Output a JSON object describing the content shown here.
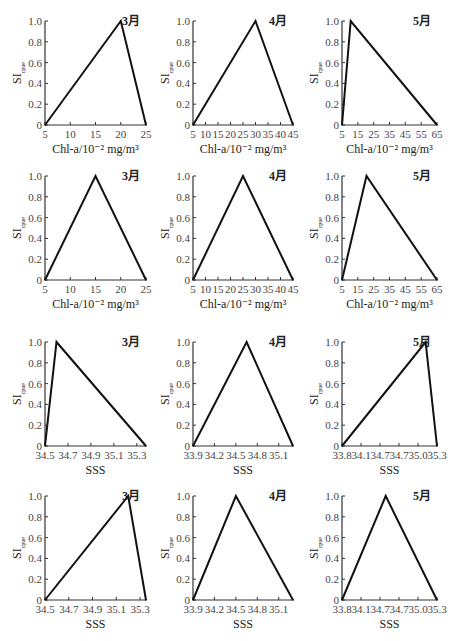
{
  "figure": {
    "ylabel_main": "SI",
    "ylabel_sub": "cpue"
  },
  "chart_data": [
    {
      "type": "line",
      "row": 1,
      "col": 1,
      "month": "3月",
      "xlabel": "Chl-a/10⁻² mg/m³",
      "ylabel": "SI_cpue",
      "xticks": [
        "5",
        "10",
        "15",
        "20",
        "25"
      ],
      "xlim": [
        5,
        25
      ],
      "yticks": [
        "0",
        "0.2",
        "0.4",
        "0.6",
        "0.8",
        "1.0"
      ],
      "ylim": [
        0,
        1
      ],
      "points": [
        [
          5,
          0
        ],
        [
          20,
          1.0
        ],
        [
          25,
          0
        ]
      ]
    },
    {
      "type": "line",
      "row": 1,
      "col": 2,
      "month": "4月",
      "xlabel": "Chl-a/10⁻² mg/m³",
      "ylabel": "SI_cpue",
      "xticks": [
        "5",
        "10",
        "15",
        "20",
        "25",
        "30",
        "35",
        "40",
        "45"
      ],
      "xlim": [
        5,
        45
      ],
      "yticks": [
        "0",
        "0.2",
        "0.4",
        "0.6",
        "0.8",
        "1.0"
      ],
      "ylim": [
        0,
        1
      ],
      "points": [
        [
          5,
          0
        ],
        [
          30,
          1.0
        ],
        [
          45,
          0
        ]
      ]
    },
    {
      "type": "line",
      "row": 1,
      "col": 3,
      "month": "5月",
      "xlabel": "Chl-a/10⁻² mg/m³",
      "ylabel": "SI_cpue",
      "xticks": [
        "5",
        "15",
        "25",
        "35",
        "45",
        "55",
        "65"
      ],
      "xlim": [
        5,
        65
      ],
      "yticks": [
        "0",
        "0.2",
        "0.4",
        "0.6",
        "0.8",
        "1.0"
      ],
      "ylim": [
        0,
        1
      ],
      "points": [
        [
          5,
          0
        ],
        [
          10.5,
          1.0
        ],
        [
          65,
          0
        ]
      ]
    },
    {
      "type": "line",
      "row": 2,
      "col": 1,
      "month": "3月",
      "xlabel": "Chl-a/10⁻² mg/m³",
      "ylabel": "SI_cpue",
      "xticks": [
        "5",
        "10",
        "15",
        "20",
        "25"
      ],
      "xlim": [
        5,
        25
      ],
      "yticks": [
        "0",
        "0.2",
        "0.4",
        "0.6",
        "0.8",
        "1.0"
      ],
      "ylim": [
        0,
        1
      ],
      "points": [
        [
          5,
          0
        ],
        [
          15,
          1.0
        ],
        [
          25,
          0
        ]
      ]
    },
    {
      "type": "line",
      "row": 2,
      "col": 2,
      "month": "4月",
      "xlabel": "Chl-a/10⁻² mg/m³",
      "ylabel": "SI_cpue",
      "xticks": [
        "5",
        "10",
        "15",
        "20",
        "25",
        "30",
        "35",
        "40",
        "45"
      ],
      "xlim": [
        5,
        45
      ],
      "yticks": [
        "0",
        "0.2",
        "0.4",
        "0.6",
        "0.8",
        "1.0"
      ],
      "ylim": [
        0,
        1
      ],
      "points": [
        [
          5,
          0
        ],
        [
          25,
          1.0
        ],
        [
          45,
          0
        ]
      ]
    },
    {
      "type": "line",
      "row": 2,
      "col": 3,
      "month": "5月",
      "xlabel": "Chl-a/10⁻² mg/m³",
      "ylabel": "SI_cpue",
      "xticks": [
        "5",
        "15",
        "25",
        "35",
        "45",
        "55",
        "65"
      ],
      "xlim": [
        5,
        65
      ],
      "yticks": [
        "0",
        "0.2",
        "0.4",
        "0.6",
        "0.8",
        "1.0"
      ],
      "ylim": [
        0,
        1
      ],
      "points": [
        [
          5,
          0
        ],
        [
          20.5,
          1.0
        ],
        [
          65,
          0
        ]
      ]
    },
    {
      "type": "line",
      "row": 3,
      "col": 1,
      "month": "3月",
      "xlabel": "SSS",
      "ylabel": "SI_cpue",
      "xticks": [
        "34.5",
        "34.7",
        "34.9",
        "35.1",
        "35.3"
      ],
      "xtick_values": [
        34.5,
        34.7,
        34.9,
        35.1,
        35.3
      ],
      "xlim": [
        34.5,
        35.38
      ],
      "yticks": [
        "0",
        "0.2",
        "0.4",
        "0.6",
        "0.8",
        "1.0"
      ],
      "ylim": [
        0,
        1
      ],
      "points": [
        [
          34.5,
          0
        ],
        [
          34.6,
          1.0
        ],
        [
          35.38,
          0
        ]
      ]
    },
    {
      "type": "line",
      "row": 3,
      "col": 2,
      "month": "4月",
      "xlabel": "SSS",
      "ylabel": "SI_cpue",
      "xticks": [
        "33.9",
        "34.2",
        "34.5",
        "34.8",
        "35.1"
      ],
      "xtick_values": [
        33.9,
        34.2,
        34.5,
        34.8,
        35.1
      ],
      "xlim": [
        33.9,
        35.3
      ],
      "yticks": [
        "0",
        "0.2",
        "0.4",
        "0.6",
        "0.8",
        "1.0"
      ],
      "ylim": [
        0,
        1
      ],
      "points": [
        [
          33.9,
          0
        ],
        [
          34.65,
          1.0
        ],
        [
          35.3,
          0
        ]
      ]
    },
    {
      "type": "line",
      "row": 3,
      "col": 3,
      "month": "5月",
      "xlabel": "SSS",
      "ylabel": "SI_cpue",
      "xticks": [
        "33.8",
        "34.1",
        "34.7",
        "34.7",
        "35.0",
        "35.3"
      ],
      "xtick_positions": [
        0,
        0.2,
        0.4,
        0.6,
        0.8,
        1.0
      ],
      "xlim": [
        33.8,
        35.3
      ],
      "yticks": [
        "0",
        "0.2",
        "0.4",
        "0.6",
        "0.8",
        "1.0"
      ],
      "ylim": [
        0,
        1
      ],
      "points_normalized": [
        [
          0,
          0
        ],
        [
          0.88,
          1.0
        ],
        [
          1.0,
          0
        ]
      ]
    },
    {
      "type": "line",
      "row": 4,
      "col": 1,
      "month": "3月",
      "xlabel": "SSS",
      "ylabel": "SI_cpue",
      "xticks": [
        "34.5",
        "34.7",
        "34.9",
        "35.1",
        "35.3"
      ],
      "xtick_values": [
        34.5,
        34.7,
        34.9,
        35.1,
        35.3
      ],
      "xlim": [
        34.5,
        35.35
      ],
      "yticks": [
        "0",
        "0.2",
        "0.4",
        "0.6",
        "0.8",
        "1.0"
      ],
      "ylim": [
        0,
        1
      ],
      "points": [
        [
          34.5,
          0
        ],
        [
          35.2,
          1.0
        ],
        [
          35.35,
          0
        ]
      ]
    },
    {
      "type": "line",
      "row": 4,
      "col": 2,
      "month": "4月",
      "xlabel": "SSS",
      "ylabel": "SI_cpue",
      "xticks": [
        "33.9",
        "34.2",
        "34.5",
        "34.8",
        "35.1"
      ],
      "xtick_values": [
        33.9,
        34.2,
        34.5,
        34.8,
        35.1
      ],
      "xlim": [
        33.9,
        35.3
      ],
      "yticks": [
        "0",
        "0.2",
        "0.4",
        "0.6",
        "0.8",
        "1.0"
      ],
      "ylim": [
        0,
        1
      ],
      "points": [
        [
          33.9,
          0
        ],
        [
          34.5,
          1.0
        ],
        [
          35.3,
          0
        ]
      ]
    },
    {
      "type": "line",
      "row": 4,
      "col": 3,
      "month": "5月",
      "xlabel": "SSS",
      "ylabel": "SI_cpue",
      "xticks": [
        "33.8",
        "34.1",
        "34.7",
        "34.7",
        "35.0",
        "35.3"
      ],
      "xtick_positions": [
        0,
        0.2,
        0.4,
        0.6,
        0.8,
        1.0
      ],
      "xlim": [
        33.8,
        35.3
      ],
      "yticks": [
        "0",
        "0.2",
        "0.4",
        "0.6",
        "0.8",
        "1.0"
      ],
      "ylim": [
        0,
        1
      ],
      "points_normalized": [
        [
          0,
          0
        ],
        [
          0.46,
          1.0
        ],
        [
          1.0,
          0
        ]
      ]
    }
  ]
}
